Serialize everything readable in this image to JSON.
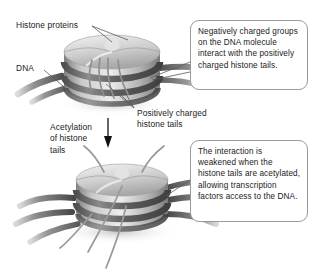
{
  "figure": {
    "background_color": "#ffffff",
    "ink_color": "#1a1a1a",
    "box_border_color": "#9a9a9a"
  },
  "labels": {
    "histone_proteins": "Histone proteins",
    "dna": "DNA",
    "positively_charged_histone_tails": "Positively charged\nhistone tails",
    "acetylation_of_histone_tails": "Acetylation\nof histone\ntails"
  },
  "callouts": {
    "top": "Negatively charged groups on the DNA molecule interact with the positively charged histone tails.",
    "bottom": "The interaction is weakened when the histone tails are acetylated, allowing transcription factors access to the DNA."
  },
  "diagram": {
    "top_nucleosome_state": "condensed",
    "bottom_nucleosome_state": "acetylated",
    "transition_arrow": "downward-arrow",
    "histone_core_color": "#bdbdbd",
    "histone_highlight_color": "#ebebeb",
    "dna_strand_color": "#6a6a6a",
    "tail_color": "#8d8d8d"
  }
}
